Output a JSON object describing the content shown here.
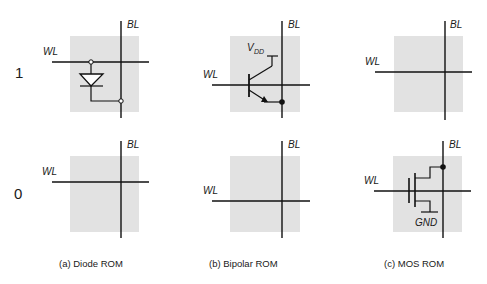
{
  "colors": {
    "cell_background": "#e2e2e2",
    "line": "#111111",
    "text": "#1a1a1a",
    "page": "#ffffff"
  },
  "rows": [
    {
      "label": "1"
    },
    {
      "label": "0"
    }
  ],
  "labels": {
    "word_line": "WL",
    "bit_line": "BL",
    "vdd_main": "V",
    "vdd_sub": "DD",
    "gnd": "GND"
  },
  "columns": [
    {
      "caption": "(a) Diode ROM",
      "cell_1": "diode between WL and BL",
      "cell_0": "no device"
    },
    {
      "caption": "(b) Bipolar ROM",
      "cell_1": "bipolar transistor, base on WL, collector to VDD, emitter to BL",
      "cell_0": "no device"
    },
    {
      "caption": "(c) MOS ROM",
      "cell_1": "no device",
      "cell_0": "MOS transistor, gate on WL, drain to BL, source to GND"
    }
  ]
}
